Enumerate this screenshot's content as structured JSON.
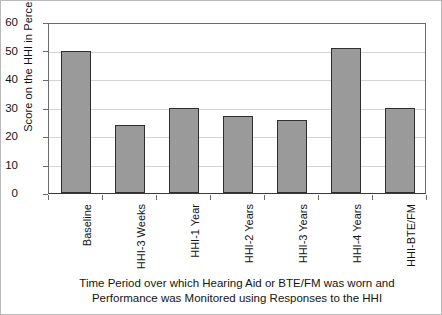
{
  "chart_data": {
    "type": "bar",
    "title": "",
    "subtitle": "",
    "categories": [
      "Baseline",
      "HHI-3 Weeks",
      "HHI-1 Year",
      "HHI-2 Years",
      "HHI-3 Years",
      "HHI-4 Years",
      "HHI-BTE/FM"
    ],
    "values": [
      50,
      24,
      30,
      27,
      25.5,
      51,
      30
    ],
    "ylabel": "Score on the HHI in Percent",
    "xlabel": "Time Period over which Hearing Aid or BTE/FM was worn and Performance was Monitored using Responses to the HHI",
    "xlabel_lines": [
      "Time Period over which Hearing Aid or BTE/FM was worn and",
      "Performance was Monitored using Responses to the HHI"
    ],
    "ylim": [
      0,
      60
    ],
    "ytick_labels": [
      "60",
      "50",
      "40",
      "30",
      "20",
      "10",
      "0"
    ],
    "ytick_values": [
      60,
      50,
      40,
      30,
      20,
      10,
      0
    ],
    "grid": "horizontal",
    "legend": "none",
    "bar_fill_color": "#9a9a9a",
    "bar_edge_color": "#2e2e2e",
    "gridline_color": "#d4d4d4",
    "axis_color": "#3a3a3a",
    "background_color": "#ffffff"
  }
}
